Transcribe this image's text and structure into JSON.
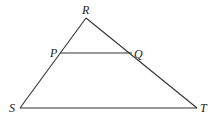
{
  "diagram": {
    "type": "triangle",
    "points": {
      "R": {
        "label": "R",
        "x": 86,
        "y": 18
      },
      "P": {
        "label": "P",
        "x": 60,
        "y": 53
      },
      "Q": {
        "label": "Q",
        "x": 132,
        "y": 53
      },
      "S": {
        "label": "S",
        "x": 20,
        "y": 108
      },
      "T": {
        "label": "T",
        "x": 197,
        "y": 108
      }
    },
    "segments": [
      "RS",
      "RT",
      "ST",
      "PQ"
    ]
  }
}
